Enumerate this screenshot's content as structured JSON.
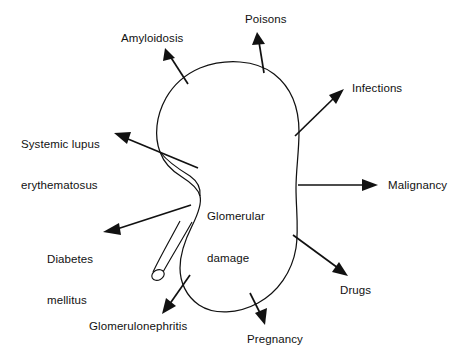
{
  "figure": {
    "type": "diagram",
    "center_label": "Glomerular\ndamage",
    "center_label_line1": "Glomerular",
    "center_label_line2": "damage",
    "background_color": "#ffffff",
    "ink_color": "#111111"
  },
  "causes": [
    {
      "id": "amyloidosis",
      "label": "Amyloidosis",
      "direction": "up-left"
    },
    {
      "id": "poisons",
      "label": "Poisons",
      "direction": "up"
    },
    {
      "id": "infections",
      "label": "Infections",
      "direction": "up-right"
    },
    {
      "id": "malignancy",
      "label": "Malignancy",
      "direction": "right"
    },
    {
      "id": "drugs",
      "label": "Drugs",
      "direction": "down-right"
    },
    {
      "id": "pregnancy",
      "label": "Pregnancy",
      "direction": "down"
    },
    {
      "id": "glomerulonephritis",
      "label": "Glomerulonephritis",
      "direction": "down-left"
    },
    {
      "id": "diabetes-mellitus",
      "label": "Diabetes\nmellitus",
      "line1": "Diabetes",
      "line2": "mellitus",
      "direction": "left-down"
    },
    {
      "id": "systemic-lupus-erythematosus",
      "label": "Systemic lupus\nerythematosus",
      "line1": "Systemic lupus",
      "line2": "erythematosus",
      "direction": "left-up"
    }
  ]
}
